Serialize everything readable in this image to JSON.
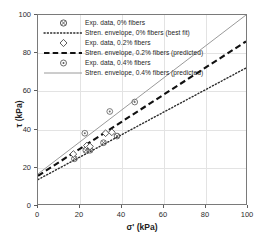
{
  "chart_data": {
    "type": "scatter",
    "title": "",
    "xlabel": "σ' (kPa)",
    "ylabel": "τ (kPa)",
    "xlim": [
      0,
      100
    ],
    "ylim": [
      0,
      100
    ],
    "xticks": [
      0,
      20,
      40,
      60,
      80,
      100
    ],
    "yticks": [
      0,
      20,
      40,
      60,
      80,
      100
    ],
    "grid": true,
    "legend_position": "upper-left-inside",
    "series": [
      {
        "name": "Exp. data, 0% fibers",
        "kind": "scatter",
        "marker": "circle-cross",
        "color": "#5a5a5a",
        "points": [
          {
            "x": 17.5,
            "y": 24.0
          },
          {
            "x": 23.0,
            "y": 28.5
          },
          {
            "x": 25.0,
            "y": 28.5
          },
          {
            "x": 31.5,
            "y": 32.5
          },
          {
            "x": 38.0,
            "y": 36.0
          }
        ]
      },
      {
        "name": "Stren. envelope, 0% fibers (best fit)",
        "kind": "line",
        "linestyle": "dotted",
        "color": "#2b2b2b",
        "intercept": 13.0,
        "slope": 0.59,
        "endpoints": [
          {
            "x": 0,
            "y": 13.0
          },
          {
            "x": 100,
            "y": 72.0
          }
        ]
      },
      {
        "name": "Exp. data, 0.2% fibers",
        "kind": "scatter",
        "marker": "diamond-open",
        "color": "#4a4a4a",
        "points": [
          {
            "x": 17.0,
            "y": 26.5
          },
          {
            "x": 23.5,
            "y": 31.0
          },
          {
            "x": 25.0,
            "y": 30.5
          },
          {
            "x": 32.5,
            "y": 37.5
          },
          {
            "x": 35.5,
            "y": 38.0
          }
        ]
      },
      {
        "name": "Stren. envelope, 0.2% fibers (predicted)",
        "kind": "line",
        "linestyle": "dashed",
        "color": "#111111",
        "intercept": 15.0,
        "slope": 0.71,
        "endpoints": [
          {
            "x": 0,
            "y": 15.0
          },
          {
            "x": 100,
            "y": 86.0
          }
        ]
      },
      {
        "name": "Exp. data, 0.4% fibers",
        "kind": "scatter",
        "marker": "circle-dot",
        "color": "#6a6a6a",
        "points": [
          {
            "x": 22.5,
            "y": 37.5
          },
          {
            "x": 34.5,
            "y": 49.0
          },
          {
            "x": 46.5,
            "y": 54.0
          }
        ]
      },
      {
        "name": "Stren. envelope, 0.4% fibers (predicted)",
        "kind": "line",
        "linestyle": "solid",
        "color": "#9a9a9a",
        "intercept": 16.0,
        "slope": 0.84,
        "endpoints": [
          {
            "x": 0,
            "y": 16.0
          },
          {
            "x": 100,
            "y": 100.0
          }
        ]
      }
    ]
  },
  "axes": {
    "xlabel": "σ' (kPa)",
    "ylabel": "τ (kPa)",
    "xticklabels": [
      "0",
      "20",
      "40",
      "60",
      "80",
      "100"
    ],
    "yticklabels": [
      "0",
      "20",
      "40",
      "60",
      "80",
      "100"
    ]
  },
  "legend": {
    "entries": [
      {
        "label": "Exp. data, 0% fibers",
        "key": "marker-circle-cross"
      },
      {
        "label": "Stren. envelope, 0% fibers (best fit)",
        "key": "line-dotted"
      },
      {
        "label": "Exp. data, 0.2% fibers",
        "key": "marker-diamond-open"
      },
      {
        "label": "Stren. envelope, 0.2% fibers (predicted)",
        "key": "line-dashed"
      },
      {
        "label": "Exp. data, 0.4% fibers",
        "key": "marker-circle-dot"
      },
      {
        "label": "Stren. envelope, 0.4% fibers (predicted)",
        "key": "line-solid"
      }
    ]
  },
  "colors": {
    "frame": "#7a7a7a",
    "grid": "#e3e3e3",
    "fit_0": "#2b2b2b",
    "fit_02": "#111111",
    "fit_04": "#9a9a9a"
  }
}
